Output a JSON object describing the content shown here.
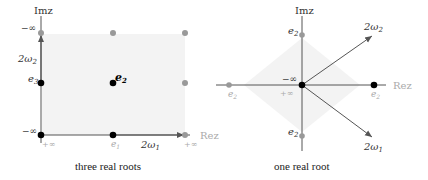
{
  "left_panel": {
    "caption": "three real roots",
    "axis_labels": {
      "im": "Imz",
      "re": "Rez"
    },
    "labels": {
      "top_neg_inf": "−∞",
      "omega2": "2ω",
      "omega2_sub": "2",
      "e3": "e",
      "e3_sub": "3",
      "e2": "e",
      "e2_sub": "2",
      "bottom_neg_inf": "−∞",
      "plus_inf_left": "+∞",
      "e1": "e",
      "e1_sub": "1",
      "omega1": "2ω",
      "omega1_sub": "1",
      "plus_inf_right": "+∞"
    }
  },
  "right_panel": {
    "caption": "one real root",
    "axis_labels": {
      "im": "Imz",
      "re": "Rez"
    },
    "labels": {
      "e2_top": "e",
      "e2_bottom": "e",
      "e2_left": "e",
      "e2_right": "e",
      "e2_sub": "2",
      "neg_inf": "−∞",
      "plus_inf": "+∞",
      "omega2": "2ω",
      "omega2_sub": "2",
      "omega1": "2ω",
      "omega1_sub": "1"
    }
  },
  "colors": {
    "axis": "#555555",
    "dot_black": "#000000",
    "dot_grey": "#999999",
    "label_grey": "#aaaaaa",
    "shade": "#f2f2f2"
  }
}
